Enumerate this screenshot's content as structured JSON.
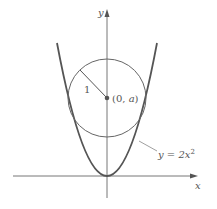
{
  "figure": {
    "axes": {
      "x_label": "x",
      "y_label": "y"
    },
    "curve": {
      "label": "y = 2x",
      "exponent": "2",
      "equation": "y = 2x^2"
    },
    "circle": {
      "radius_label": "1",
      "center_label_prefix": "(0, ",
      "center_label_var": "a",
      "center_label_suffix": ")"
    },
    "colors": {
      "curve": "#555555",
      "axes": "#777777",
      "circle": "#666666",
      "center_dot": "#555555"
    }
  }
}
